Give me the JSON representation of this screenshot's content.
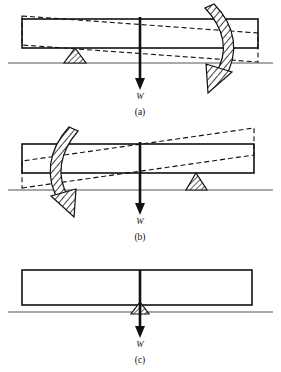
{
  "figure": {
    "background_color": "#ffffff",
    "ink_color": "#111111",
    "ground_color": "#555555",
    "width": 281,
    "height": 372
  },
  "panels": [
    {
      "id": "a",
      "caption": "(a)",
      "caption_x": 140,
      "caption_y": 112,
      "load_label": "W",
      "load_label_x": 140,
      "load_label_y": 97,
      "fulcrum_side": "left",
      "fulcrum_x": 75,
      "rotation_sense": "clockwise",
      "arrow_side": "right",
      "beam": {
        "x": 22,
        "y": 19,
        "width": 236,
        "height": 29
      },
      "ground_y": 63,
      "tilt_deg": 4.0,
      "load_arrow": {
        "x": 140,
        "y_top": 17,
        "y_bottom": 88
      }
    },
    {
      "id": "b",
      "caption": "(b)",
      "caption_x": 140,
      "caption_y": 237,
      "load_label": "W",
      "load_label_x": 140,
      "load_label_y": 221,
      "fulcrum_side": "right",
      "fulcrum_x": 196,
      "rotation_sense": "counterclockwise",
      "arrow_side": "left",
      "beam": {
        "x": 22,
        "y": 144,
        "width": 232,
        "height": 29
      },
      "ground_y": 190,
      "tilt_deg": -4.0,
      "load_arrow": {
        "x": 140,
        "y_top": 142,
        "y_bottom": 213
      }
    },
    {
      "id": "c",
      "caption": "(c)",
      "caption_x": 140,
      "caption_y": 360,
      "load_label": "W",
      "load_label_x": 140,
      "load_label_y": 345,
      "fulcrum_side": "center",
      "fulcrum_x": 140,
      "rotation_sense": "none",
      "arrow_side": "none",
      "beam": {
        "x": 22,
        "y": 270,
        "width": 230,
        "height": 35
      },
      "ground_y": 312,
      "tilt_deg": 0.0,
      "load_arrow": {
        "x": 140,
        "y_top": 270,
        "y_bottom": 336
      }
    }
  ],
  "legend_notes": {
    "solid_outline_meaning": "undeformed beam",
    "dashed_outline_meaning": "rotated / displaced beam",
    "curved_hatched_arrow_meaning": "moment / rotation direction",
    "hatched_triangle_meaning": "fulcrum support",
    "vertical_arrow_meaning": "applied load W"
  }
}
